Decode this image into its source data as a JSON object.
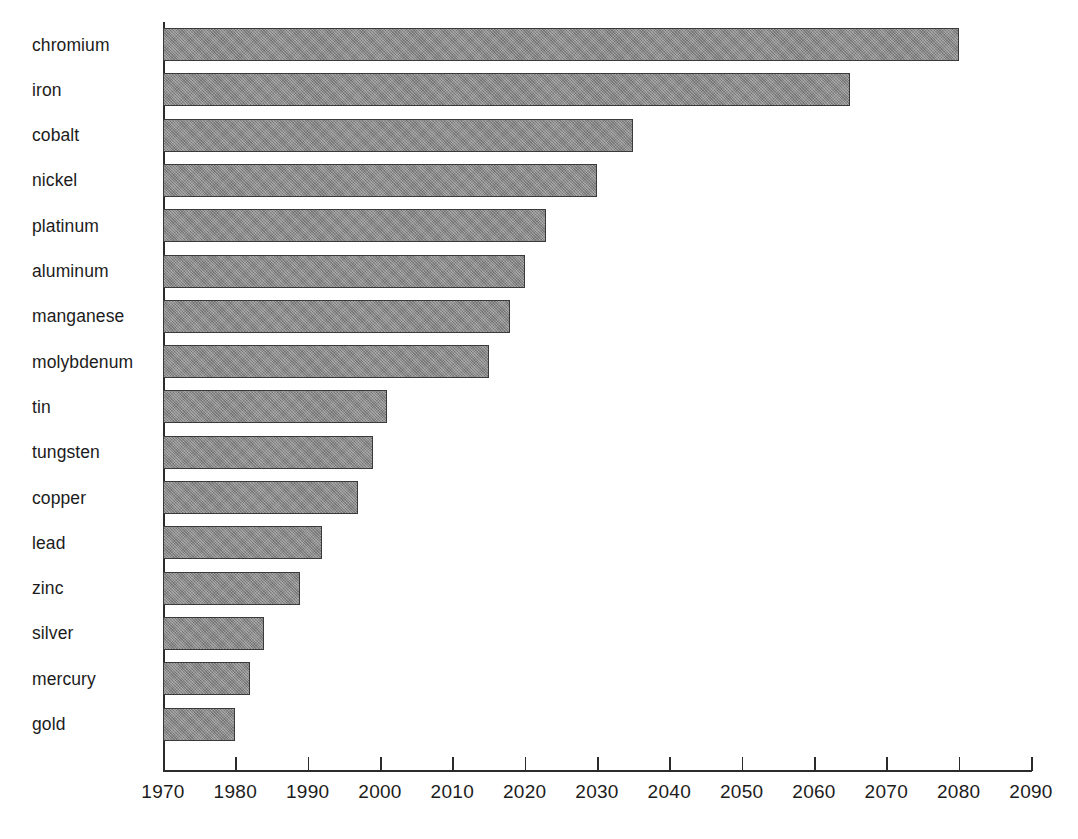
{
  "chart_data": {
    "type": "bar",
    "orientation": "horizontal",
    "title": "",
    "subtitle": "",
    "xlabel": "",
    "ylabel": "",
    "xlim": [
      1970,
      2090
    ],
    "x_tick_step": 10,
    "grid": false,
    "legend": null,
    "bar_color": "#8a8a8a",
    "bar_border_color": "#3a3a3a",
    "axis_color": "#2b2b2b",
    "background_color": "#ffffff",
    "categories": [
      "chromium",
      "iron",
      "cobalt",
      "nickel",
      "platinum",
      "aluminum",
      "manganese",
      "molybdenum",
      "tin",
      "tungsten",
      "copper",
      "lead",
      "zinc",
      "silver",
      "mercury",
      "gold"
    ],
    "values": [
      2080,
      2065,
      2035,
      2030,
      2023,
      2020,
      2018,
      2015,
      2001,
      1999,
      1997,
      1992,
      1989,
      1984,
      1982,
      1980
    ],
    "x_ticks": [
      1970,
      1980,
      1990,
      2000,
      2010,
      2020,
      2030,
      2040,
      2050,
      2060,
      2070,
      2080,
      2090
    ],
    "x_tick_labels": [
      "1970",
      "1980",
      "1990",
      "2000",
      "2010",
      "2020",
      "2030",
      "2040",
      "2050",
      "2060",
      "2070",
      "2080",
      "2090"
    ]
  }
}
